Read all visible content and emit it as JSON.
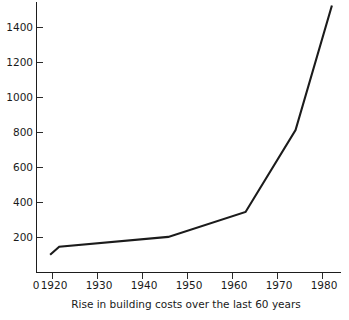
{
  "chart_data": {
    "type": "line",
    "title": "",
    "caption": "Rise in building costs over the last 60 years",
    "xlabel": "",
    "ylabel": "",
    "grid": false,
    "legend": false,
    "xlim": [
      1915,
      1982
    ],
    "ylim": [
      0,
      1520
    ],
    "x_tick_labels": [
      "0",
      "1920",
      "1930",
      "1940",
      "1950",
      "1960",
      "1970",
      "1980"
    ],
    "x_tick_values": [
      1915,
      1920,
      1930,
      1940,
      1950,
      1960,
      1970,
      1980
    ],
    "y_tick_labels": [
      "200",
      "400",
      "600",
      "800",
      "1000",
      "1200",
      "1400"
    ],
    "y_tick_values": [
      200,
      400,
      600,
      800,
      1000,
      1200,
      1400
    ],
    "series": [
      {
        "name": "Building cost index",
        "x": [
          1918,
          1920,
          1944,
          1961,
          1972,
          1980
        ],
        "values": [
          100,
          145,
          200,
          340,
          800,
          1500
        ]
      }
    ]
  },
  "figure": {
    "background_color": "#ffffff",
    "line_color": "#1b1b1b",
    "axis_color": "#1d1d1d"
  }
}
